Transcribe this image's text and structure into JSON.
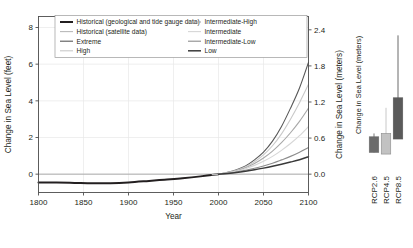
{
  "chart_data": {
    "type": "line",
    "title": "",
    "xlabel": "Year",
    "ylabel": "Change in Sea Level (feet)",
    "ylabel_right": "Change in Sea Level (meters)",
    "xlim": [
      1800,
      2100
    ],
    "ylim": [
      -1.0,
      8.6
    ],
    "ylim_right": [
      -0.3048,
      2.621
    ],
    "xticks": [
      "1800",
      "1850",
      "1900",
      "1950",
      "2000",
      "2050",
      "2100"
    ],
    "xtick_values": [
      1800,
      1850,
      1900,
      1950,
      2000,
      2050,
      2100
    ],
    "yticks": [
      "0",
      "2",
      "4",
      "6",
      "8"
    ],
    "ytick_values": [
      0,
      2,
      4,
      6,
      8
    ],
    "yticks_right": [
      "0.0",
      "0.6",
      "1.2",
      "1.8",
      "2.4"
    ],
    "ytick_values_right": [
      0.0,
      0.6,
      1.2,
      1.8,
      2.4
    ],
    "grid": true,
    "legend_position": "top-left",
    "x": [
      1800,
      1850,
      1900,
      1950,
      2000,
      2010,
      2020,
      2030,
      2040,
      2050,
      2060,
      2070,
      2080,
      2090,
      2100
    ],
    "series": [
      {
        "name": "Historical (geological and tide gauge data)",
        "color": "#231f20",
        "width": 2.0,
        "x": [
          1800,
          1820,
          1840,
          1860,
          1880,
          1900,
          1920,
          1940,
          1960,
          1980,
          2000
        ],
        "values": [
          -0.45,
          -0.46,
          -0.48,
          -0.5,
          -0.49,
          -0.45,
          -0.38,
          -0.3,
          -0.22,
          -0.12,
          0.0
        ]
      },
      {
        "name": "Historical (satellite data)",
        "color": "#b9b9b9",
        "width": 1.3,
        "x": [
          1993,
          1996,
          1999,
          2002,
          2005,
          2008,
          2011,
          2014,
          2017,
          2020
        ],
        "values": [
          -0.03,
          -0.02,
          -0.01,
          0.01,
          0.02,
          0.04,
          0.06,
          0.08,
          0.1,
          0.13
        ]
      },
      {
        "name": "Extreme",
        "color": "#585858",
        "width": 1.1,
        "x": [
          2000,
          2010,
          2020,
          2030,
          2040,
          2050,
          2060,
          2070,
          2080,
          2090,
          2100
        ],
        "values": [
          0.0,
          0.1,
          0.24,
          0.45,
          0.78,
          1.2,
          1.8,
          2.6,
          3.6,
          4.7,
          6.1
        ]
      },
      {
        "name": "High",
        "color": "#c9c9c9",
        "width": 1.1,
        "x": [
          2000,
          2010,
          2020,
          2030,
          2040,
          2050,
          2060,
          2070,
          2080,
          2090,
          2100
        ],
        "values": [
          0.0,
          0.09,
          0.21,
          0.4,
          0.68,
          1.05,
          1.55,
          2.2,
          3.0,
          3.9,
          4.9
        ]
      },
      {
        "name": "Intermediate-High",
        "color": "#a8a8a8",
        "width": 1.1,
        "x": [
          2000,
          2010,
          2020,
          2030,
          2040,
          2050,
          2060,
          2070,
          2080,
          2090,
          2100
        ],
        "values": [
          0.0,
          0.08,
          0.19,
          0.35,
          0.58,
          0.88,
          1.26,
          1.72,
          2.26,
          2.88,
          3.6
        ]
      },
      {
        "name": "Intermediate",
        "color": "#d6d6d6",
        "width": 1.1,
        "x": [
          2000,
          2010,
          2020,
          2030,
          2040,
          2050,
          2060,
          2070,
          2080,
          2090,
          2100
        ],
        "values": [
          0.0,
          0.07,
          0.17,
          0.3,
          0.48,
          0.7,
          0.97,
          1.3,
          1.67,
          2.1,
          2.6
        ]
      },
      {
        "name": "Intermediate-Low",
        "color": "#8c8c8c",
        "width": 1.1,
        "x": [
          2000,
          2010,
          2020,
          2030,
          2040,
          2050,
          2060,
          2070,
          2080,
          2090,
          2100
        ],
        "values": [
          0.0,
          0.05,
          0.12,
          0.21,
          0.32,
          0.45,
          0.6,
          0.78,
          0.97,
          1.2,
          1.45
        ]
      },
      {
        "name": "Low",
        "color": "#3a3a3a",
        "width": 1.5,
        "x": [
          2000,
          2010,
          2020,
          2030,
          2040,
          2050,
          2060,
          2070,
          2080,
          2090,
          2100
        ],
        "values": [
          0.0,
          0.04,
          0.09,
          0.16,
          0.24,
          0.33,
          0.43,
          0.54,
          0.66,
          0.79,
          0.95
        ]
      }
    ],
    "inset_panel": {
      "type": "bar",
      "ylabel": "Change in Sea Level (meters)",
      "categories": [
        "RCP2.6",
        "RCP4.5",
        "RCP8.5"
      ],
      "boxes": [
        {
          "label": "RCP2.6",
          "color": "#6b6b6b",
          "box_low": 0.28,
          "box_high": 0.56,
          "whisker_low": 0.28,
          "whisker_high": 0.62
        },
        {
          "label": "RCP4.5",
          "color": "#c2c2c2",
          "box_low": 0.25,
          "box_high": 0.62,
          "whisker_low": 0.25,
          "whisker_high": 1.08
        },
        {
          "label": "RCP8.5",
          "color": "#5a5a5a",
          "box_low": 0.52,
          "box_high": 1.26,
          "whisker_low": 0.52,
          "whisker_high": 2.38
        }
      ]
    }
  },
  "legend": {
    "entries": [
      {
        "label": "Historical (geological and tide gauge data)",
        "color": "#231f20"
      },
      {
        "label": "Historical (satellite data)",
        "color": "#b9b9b9"
      },
      {
        "label": "Extreme",
        "color": "#585858"
      },
      {
        "label": "High",
        "color": "#c9c9c9"
      },
      {
        "label": "Intermediate-High",
        "color": "#a8a8a8"
      },
      {
        "label": "Intermediate",
        "color": "#d6d6d6"
      },
      {
        "label": "Intermediate-Low",
        "color": "#8c8c8c"
      },
      {
        "label": "Low",
        "color": "#3a3a3a"
      }
    ]
  }
}
